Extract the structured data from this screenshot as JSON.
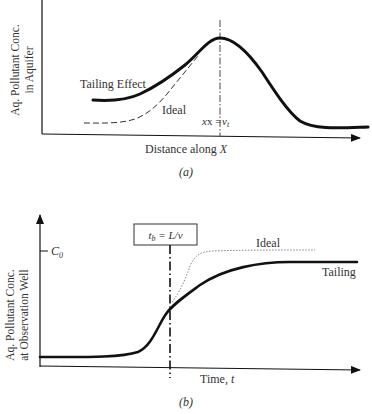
{
  "panel_a": {
    "y_label_line1": "Aq. Pollutant Conc.",
    "y_label_line2": "in Aquifer",
    "x_label_prefix": "Distance along ",
    "x_label_var": "X",
    "tailing_label": "Tailing Effect",
    "ideal_label": "Ideal",
    "marker_label_prefix": "x = ",
    "marker_label_var": "v",
    "marker_label_sub": "t",
    "caption": "(a)"
  },
  "panel_b": {
    "y_label_line1": "Aq. Pollutant Conc.",
    "y_label_line2": "at Observation Well",
    "x_label_prefix": "Time, ",
    "x_label_var": "t",
    "c0_label": "C",
    "c0_sub": "0",
    "box_label_var": "t",
    "box_label_sub": "b",
    "box_label_rest": " = L/v",
    "ideal_label": "Ideal",
    "tailing_label": "Tailing",
    "caption": "(b)"
  },
  "colors": {
    "line": "#111111",
    "text": "#333333",
    "ideal_a": "#333333",
    "ideal_b": "#777777"
  }
}
